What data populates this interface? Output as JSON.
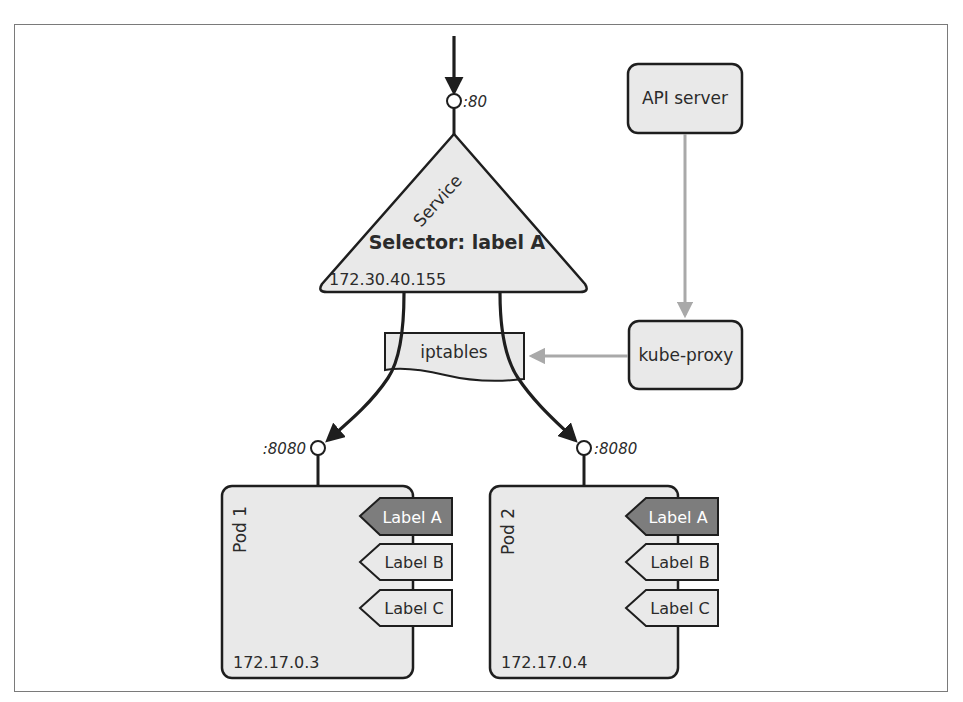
{
  "diagram": {
    "title": "",
    "colors": {
      "shape_fill": "#e9e9e9",
      "shape_stroke": "#1e1e1e",
      "selected_label_fill": "#7d7d7d",
      "selected_label_text": "#ffffff",
      "control_arrow": "#a9a9a9",
      "frame_border": "#7a7a7a"
    },
    "incoming_port": {
      "label": ":80"
    },
    "service": {
      "name": "Service",
      "selector": "Selector: label A",
      "ip": "172.30.40.155"
    },
    "iptables": {
      "label": "iptables"
    },
    "api_server": {
      "label": "API server"
    },
    "kube_proxy": {
      "label": "kube-proxy"
    },
    "pods": [
      {
        "name": "Pod 1",
        "ip": "172.17.0.3",
        "port": ":8080",
        "labels": [
          {
            "text": "Label A",
            "selected": true
          },
          {
            "text": "Label B",
            "selected": false
          },
          {
            "text": "Label C",
            "selected": false
          }
        ]
      },
      {
        "name": "Pod 2",
        "ip": "172.17.0.4",
        "port": ":8080",
        "labels": [
          {
            "text": "Label A",
            "selected": true
          },
          {
            "text": "Label B",
            "selected": false
          },
          {
            "text": "Label C",
            "selected": false
          }
        ]
      }
    ],
    "edges": [
      {
        "from": "client",
        "to": "service",
        "type": "traffic",
        "via_port": ":80"
      },
      {
        "from": "service",
        "to": "pod-1",
        "type": "traffic",
        "via": "iptables",
        "via_port": ":8080"
      },
      {
        "from": "service",
        "to": "pod-2",
        "type": "traffic",
        "via": "iptables",
        "via_port": ":8080"
      },
      {
        "from": "api-server",
        "to": "kube-proxy",
        "type": "control"
      },
      {
        "from": "kube-proxy",
        "to": "iptables",
        "type": "control"
      }
    ]
  }
}
